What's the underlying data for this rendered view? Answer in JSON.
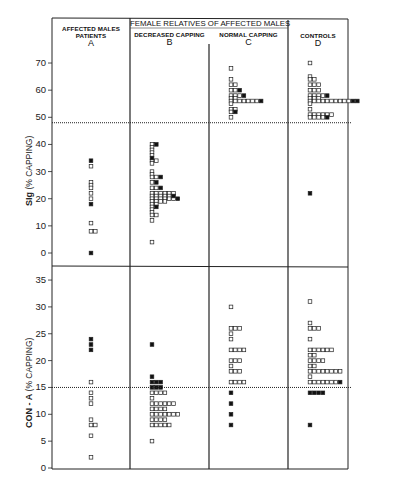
{
  "chart_data": {
    "type": "scatter",
    "subtype": "dot-strip-plot",
    "title": "",
    "header": {
      "group_label": "FEMALE RELATIVES OF AFFECTED MALES",
      "columns": [
        {
          "id": "A",
          "label": "AFFECTED MALES PATIENTS",
          "line1": "AFFECTED MALES",
          "line2": "PATIENTS",
          "letter": "A"
        },
        {
          "id": "B",
          "label": "DECREASED CAPPING",
          "line1": "DECREASED CAPPING",
          "line2": "",
          "letter": "B"
        },
        {
          "id": "C",
          "label": "NORMAL CAPPING",
          "line1": "NORMAL CAPPING",
          "line2": "",
          "letter": "C"
        },
        {
          "id": "D",
          "label": "CONTROLS",
          "line1": "CONTROLS",
          "line2": "",
          "letter": "D"
        }
      ]
    },
    "legend": {
      "open_square": "individual (open)",
      "filled_square": "individual (filled)"
    },
    "panels": [
      {
        "id": "sig",
        "ylabel_bold": "SIg",
        "ylabel_rest": "(% CAPPING)",
        "ylim": [
          -4,
          75
        ],
        "yticks": [
          0,
          10,
          20,
          30,
          40,
          50,
          60,
          70
        ],
        "threshold": 48,
        "grid": false,
        "series": {
          "A": {
            "open": [
              32,
              26,
              25,
              24,
              22,
              20,
              11,
              8,
              8
            ],
            "filled": [
              34,
              18,
              0
            ]
          },
          "B": {
            "open_rows": [
              [
                40,
                1
              ],
              [
                39,
                1
              ],
              [
                38,
                1
              ],
              [
                37,
                1
              ],
              [
                36,
                1
              ],
              [
                34,
                2
              ],
              [
                33,
                1
              ],
              [
                30,
                1
              ],
              [
                29,
                1
              ],
              [
                28,
                2
              ],
              [
                26,
                1
              ],
              [
                24,
                2
              ],
              [
                22,
                6
              ],
              [
                21,
                5
              ],
              [
                20,
                6
              ],
              [
                19,
                4
              ],
              [
                18,
                2
              ],
              [
                17,
                1
              ],
              [
                16,
                1
              ],
              [
                15,
                1
              ],
              [
                14,
                2
              ],
              [
                12,
                1
              ],
              [
                4,
                1
              ]
            ],
            "filled": [
              40,
              35,
              28,
              26,
              24,
              21,
              20,
              17
            ]
          },
          "C": {
            "open_rows": [
              [
                68,
                1
              ],
              [
                64,
                1
              ],
              [
                62,
                2
              ],
              [
                60,
                2
              ],
              [
                58,
                3
              ],
              [
                57,
                2
              ],
              [
                56,
                7
              ],
              [
                55,
                1
              ],
              [
                53,
                2
              ],
              [
                52,
                1
              ],
              [
                50,
                1
              ]
            ],
            "filled": [
              60,
              58,
              56,
              52
            ]
          },
          "D": {
            "open_rows": [
              [
                70,
                1
              ],
              [
                65,
                1
              ],
              [
                64,
                2
              ],
              [
                62,
                3
              ],
              [
                60,
                3
              ],
              [
                58,
                4
              ],
              [
                57,
                3
              ],
              [
                56,
                10
              ],
              [
                55,
                1
              ],
              [
                53,
                1
              ],
              [
                51,
                6
              ],
              [
                50,
                4
              ]
            ],
            "filled": [
              58,
              56,
              56,
              50,
              22
            ]
          }
        }
      },
      {
        "id": "cona",
        "ylabel_bold": "CON - A",
        "ylabel_rest": "(% CAPPING)",
        "ylim": [
          0,
          37
        ],
        "yticks": [
          0,
          5,
          10,
          15,
          20,
          25,
          30,
          35
        ],
        "threshold": 15,
        "grid": false,
        "series": {
          "A": {
            "open": [
              16,
              14,
              13,
              12,
              9,
              8,
              8,
              6,
              2
            ],
            "filled": [
              24,
              23,
              22
            ]
          },
          "B": {
            "open_rows": [
              [
                14,
                4
              ],
              [
                13,
                1
              ],
              [
                12,
                6
              ],
              [
                11,
                4
              ],
              [
                10,
                7
              ],
              [
                9,
                4
              ],
              [
                8,
                5
              ],
              [
                5,
                1
              ]
            ],
            "filled_rows": [
              [
                23,
                1
              ],
              [
                17,
                1
              ],
              [
                16,
                3
              ],
              [
                15,
                3
              ]
            ]
          },
          "C": {
            "open_rows": [
              [
                30,
                1
              ],
              [
                26,
                3
              ],
              [
                25,
                1
              ],
              [
                24,
                1
              ],
              [
                22,
                4
              ],
              [
                20,
                3
              ],
              [
                19,
                1
              ],
              [
                18,
                3
              ],
              [
                16,
                4
              ]
            ],
            "filled": [
              14,
              12,
              10,
              8
            ]
          },
          "D": {
            "open_rows": [
              [
                31,
                1
              ],
              [
                27,
                1
              ],
              [
                26,
                3
              ],
              [
                24,
                1
              ],
              [
                22,
                6
              ],
              [
                21,
                2
              ],
              [
                20,
                4
              ],
              [
                19,
                2
              ],
              [
                18,
                8
              ],
              [
                17,
                1
              ],
              [
                16,
                7
              ]
            ],
            "filled_rows": [
              [
                16,
                1
              ],
              [
                14,
                4
              ],
              [
                8,
                1
              ]
            ]
          }
        }
      }
    ]
  }
}
